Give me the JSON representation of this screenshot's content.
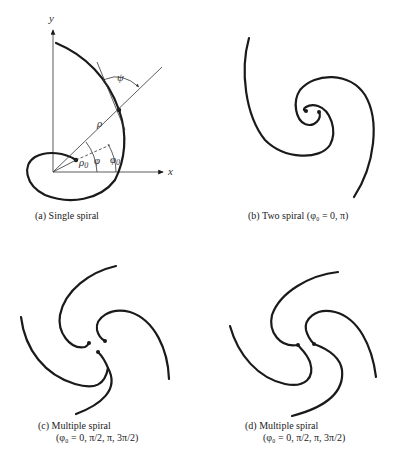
{
  "figure": {
    "panels": [
      {
        "id": "a",
        "caption_line1": "(a)  Single spiral",
        "caption_line2": "",
        "labels": {
          "y_axis": "y",
          "x_axis": "x",
          "rho": "ρ",
          "rho0": "ρ",
          "rho0_sub": "0",
          "phi": "φ",
          "phi0": "φ",
          "phi0_sub": "0",
          "psi": "ψ"
        }
      },
      {
        "id": "b",
        "caption_line1": "(b)  Two spiral (φ₀ = 0, π)",
        "caption_line2": ""
      },
      {
        "id": "c",
        "caption_line1": "(c)  Multiple spiral",
        "caption_line2": "(φ₀ = 0, π/2, π, 3π/2)"
      },
      {
        "id": "d",
        "caption_line1": "(d)  Multiple spiral",
        "caption_line2": "(φ₀ = 0, π/2, π, 3π/2)"
      }
    ]
  }
}
